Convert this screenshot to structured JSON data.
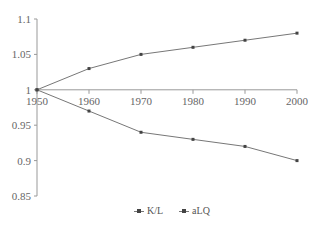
{
  "chart_data": {
    "type": "line",
    "title": "",
    "xlabel": "",
    "ylabel": "",
    "x": [
      1950,
      1960,
      1970,
      1980,
      1990,
      2000
    ],
    "series": [
      {
        "name": "K/L",
        "values": [
          1.0,
          1.03,
          1.05,
          1.06,
          1.07,
          1.08
        ]
      },
      {
        "name": "aLQ",
        "values": [
          1.0,
          0.97,
          0.94,
          0.93,
          0.92,
          0.9
        ]
      }
    ],
    "ylim": [
      0.85,
      1.1
    ],
    "yticks": [
      "0.85",
      "0.9",
      "0.95",
      "1",
      "1.05",
      "1.1"
    ],
    "xticks": [
      "1950",
      "1960",
      "1970",
      "1980",
      "1990",
      "2000"
    ],
    "x_axis_at_y": 1.0,
    "grid": false,
    "legend_position": "bottom"
  },
  "legend": {
    "items": [
      {
        "label": "K/L"
      },
      {
        "label": "aLQ"
      }
    ]
  },
  "colors": {
    "line": "#777777",
    "marker": "#444444",
    "axis": "#999999"
  }
}
